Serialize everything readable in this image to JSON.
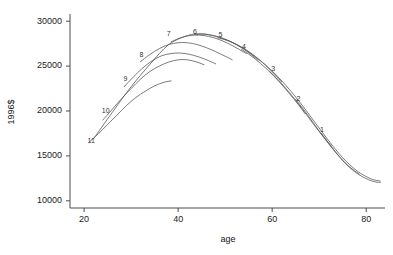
{
  "chart_data": {
    "type": "line",
    "title": "",
    "xlabel": "age",
    "ylabel": "1996$",
    "xlim": [
      17,
      84
    ],
    "ylim": [
      9200,
      30800
    ],
    "grid": false,
    "legend_position": "inline-curve-labels",
    "xticks": [
      20,
      40,
      60,
      80
    ],
    "yticks": [
      10000,
      15000,
      20000,
      25000,
      30000
    ],
    "xtick_labels": [
      "20",
      "40",
      "60",
      "80"
    ],
    "ytick_labels": [
      "10000",
      "15000",
      "20000",
      "25000",
      "30000"
    ],
    "series": [
      {
        "name": "11",
        "label": "11",
        "label_x": 21.5,
        "label_y": 16450,
        "x": [
          21.0,
          23.0,
          25.0,
          27.0,
          29.0,
          31.0,
          33.0,
          35.0,
          37.0,
          38.5
        ],
        "values": [
          16500,
          17450,
          18500,
          19550,
          20600,
          21500,
          22200,
          22800,
          23200,
          23350
        ]
      },
      {
        "name": "10",
        "label": "10",
        "label_x": 24.6,
        "label_y": 19750,
        "x": [
          24.0,
          26.0,
          28.0,
          30.0,
          32.0,
          34.0,
          36.0,
          38.0,
          40.0,
          42.0,
          44.0,
          45.5
        ],
        "values": [
          19000,
          20200,
          21400,
          22500,
          23550,
          24400,
          25000,
          25450,
          25700,
          25700,
          25450,
          25150
        ]
      },
      {
        "name": "9",
        "label": "9",
        "label_x": 28.8,
        "label_y": 23300,
        "x": [
          28.5,
          30.5,
          32.5,
          34.5,
          36.5,
          38.5,
          40.5,
          42.5,
          44.5,
          46.5,
          48.0
        ],
        "values": [
          22700,
          23800,
          24800,
          25600,
          26150,
          26400,
          26450,
          26300,
          26000,
          25600,
          25250
        ]
      },
      {
        "name": "8",
        "label": "8",
        "label_x": 32.2,
        "label_y": 26050,
        "x": [
          32.0,
          34.0,
          36.0,
          38.0,
          40.0,
          42.0,
          44.0,
          46.0,
          48.0,
          50.0,
          51.5
        ],
        "values": [
          25500,
          26300,
          26950,
          27400,
          27600,
          27600,
          27400,
          27050,
          26600,
          26100,
          25700
        ]
      },
      {
        "name": "7",
        "label": "7",
        "label_x": 38.0,
        "label_y": 28300,
        "x": [
          38.5,
          40.5,
          42.5,
          44.5,
          46.5,
          48.5,
          50.5,
          52.5,
          54.5
        ],
        "values": [
          27700,
          28150,
          28400,
          28450,
          28300,
          28000,
          27550,
          27000,
          26400
        ]
      },
      {
        "name": "6",
        "label": "6",
        "label_x": 43.6,
        "label_y": 28600,
        "x": [
          43.5,
          45.5,
          47.5,
          49.5,
          51.5,
          53.5,
          55.5,
          57.0
        ],
        "values": [
          28500,
          28550,
          28400,
          28100,
          27650,
          27050,
          26300,
          25650
        ]
      },
      {
        "name": "5",
        "label": "5",
        "label_x": 49.0,
        "label_y": 28200,
        "x": [
          48.5,
          50.5,
          52.5,
          54.5,
          56.5,
          58.5,
          60.5,
          62.0
        ],
        "values": [
          28150,
          27850,
          27400,
          26800,
          26050,
          25150,
          24100,
          23250
        ]
      },
      {
        "name": "4",
        "label": "4",
        "label_x": 54.0,
        "label_y": 26900,
        "x": [
          53.5,
          55.5,
          57.5,
          59.5,
          61.5,
          63.5,
          65.5,
          67.0
        ],
        "values": [
          26850,
          26150,
          25300,
          24350,
          23250,
          22050,
          20750,
          19700
        ]
      },
      {
        "name": "3",
        "label": "3",
        "label_x": 60.2,
        "label_y": 24450,
        "x": [
          59.5,
          61.5,
          63.5,
          65.5,
          67.5,
          69.5,
          71.5,
          72.5
        ],
        "values": [
          24400,
          23350,
          22150,
          20850,
          19450,
          18050,
          16750,
          16150
        ]
      },
      {
        "name": "2",
        "label": "2",
        "label_x": 65.6,
        "label_y": 21100,
        "x": [
          65.0,
          67.0,
          69.0,
          71.0,
          73.0,
          75.0,
          77.0,
          78.5
        ],
        "values": [
          21300,
          19950,
          18500,
          17050,
          15700,
          14500,
          13550,
          13000
        ]
      },
      {
        "name": "1",
        "label": "1",
        "label_x": 70.6,
        "label_y": 17700,
        "x": [
          70.5,
          72.5,
          74.5,
          76.5,
          78.5,
          80.5,
          82.0,
          83.0
        ],
        "values": [
          17500,
          16100,
          14800,
          13700,
          12900,
          12350,
          12100,
          12050
        ]
      },
      {
        "name": "envelope",
        "label": "",
        "label_x": null,
        "label_y": null,
        "x": [
          22.0,
          26.0,
          30.0,
          34.0,
          38.0,
          42.0,
          45.0,
          48.0,
          51.0,
          54.0,
          57.0,
          60.0,
          63.0,
          66.0,
          69.0,
          72.0,
          75.0,
          78.0,
          81.0,
          83.0
        ],
        "values": [
          16900,
          19850,
          22700,
          25200,
          27400,
          28400,
          28600,
          28300,
          27750,
          26900,
          25800,
          24450,
          22800,
          20900,
          18800,
          16700,
          14800,
          13350,
          12450,
          12200
        ]
      }
    ]
  }
}
